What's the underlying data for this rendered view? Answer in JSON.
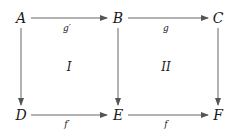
{
  "diagram": {
    "type": "commutative-diagram",
    "nodes": {
      "A": {
        "label": "A",
        "x": 21,
        "y": 18
      },
      "B": {
        "label": "B",
        "x": 118,
        "y": 18
      },
      "C": {
        "label": "C",
        "x": 218,
        "y": 18
      },
      "D": {
        "label": "D",
        "x": 21,
        "y": 115
      },
      "E": {
        "label": "E",
        "x": 118,
        "y": 115
      },
      "F": {
        "label": "F",
        "x": 218,
        "y": 115
      }
    },
    "edges": [
      {
        "from": "A",
        "to": "B",
        "label": "g′"
      },
      {
        "from": "B",
        "to": "C",
        "label": "g"
      },
      {
        "from": "D",
        "to": "E",
        "label": "f′"
      },
      {
        "from": "E",
        "to": "F",
        "label": "f"
      },
      {
        "from": "A",
        "to": "D",
        "label": ""
      },
      {
        "from": "B",
        "to": "E",
        "label": ""
      },
      {
        "from": "C",
        "to": "F",
        "label": ""
      }
    ],
    "regions": [
      {
        "label": "I"
      },
      {
        "label": "II"
      }
    ],
    "colors": {
      "stroke": "#555555",
      "text": "#1a1a1a",
      "background": "#ffffff"
    }
  }
}
